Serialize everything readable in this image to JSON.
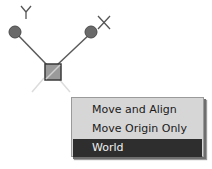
{
  "gizmo": {
    "y_axis_label": "Y",
    "x_axis_label": "X",
    "colors": {
      "handle": "#6a6a6a",
      "line": "#5a5a5a",
      "origin_fill": "#9a9a9a",
      "ghost_line": "#d8d8d8"
    }
  },
  "context_menu": {
    "items": [
      {
        "label": "Move and Align",
        "selected": false
      },
      {
        "label": "Move Origin Only",
        "selected": false
      },
      {
        "label": "World",
        "selected": true
      }
    ],
    "colors": {
      "background": "#d6d6d6",
      "selected_bg": "#2e2e2e",
      "selected_text": "#f0f0f0"
    }
  }
}
